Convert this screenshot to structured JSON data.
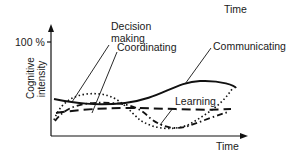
{
  "header": {
    "title": "Time"
  },
  "axes": {
    "y_tick_label": "100 %",
    "y_label_line1": "Cognitive",
    "y_label_line2": "intensity",
    "x_label": "Time"
  },
  "curves": [
    {
      "name": "Decision making",
      "label_line1": "Decision",
      "label_line2": "making",
      "style": "dashed-dotted-short"
    },
    {
      "name": "Coordinating",
      "label": "Coordinating",
      "style": "dotted"
    },
    {
      "name": "Communicating",
      "label": "Communicating",
      "style": "solid"
    },
    {
      "name": "Learning",
      "label": "Learning",
      "style": "long-dashed"
    }
  ],
  "colors": {
    "line": "#111111",
    "background": "#ffffff"
  }
}
